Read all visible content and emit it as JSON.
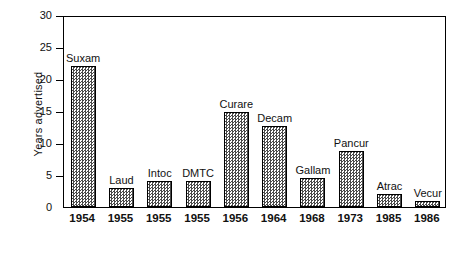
{
  "chart_data": {
    "type": "bar",
    "title": "",
    "xlabel": "",
    "ylabel": "Years advertised",
    "ylim": [
      0,
      30
    ],
    "yticks": [
      0,
      5,
      10,
      15,
      20,
      25,
      30
    ],
    "ytick_labels": [
      "0",
      "5",
      "10",
      "15",
      "20",
      "25",
      "30"
    ],
    "grid": false,
    "legend": "none",
    "categories": [
      "1954",
      "1955",
      "1955",
      "1955",
      "1956",
      "1964",
      "1968",
      "1973",
      "1985",
      "1986"
    ],
    "bar_labels": [
      "Suxam",
      "Laud",
      "Intoc",
      "DMTC",
      "Curare",
      "Decam",
      "Gallam",
      "Pancur",
      "Atrac",
      "Vecur"
    ],
    "values": [
      22,
      3,
      4,
      4,
      14.8,
      12.7,
      4.6,
      8.7,
      2,
      1
    ],
    "series": [
      {
        "name": "Years advertised",
        "values": [
          22,
          3,
          4,
          4,
          14.8,
          12.7,
          4.6,
          8.7,
          2,
          1
        ]
      }
    ],
    "bars": [
      {
        "label": "Suxam",
        "year": "1954",
        "value": 22
      },
      {
        "label": "Laud",
        "year": "1955",
        "value": 3
      },
      {
        "label": "Intoc",
        "year": "1955",
        "value": 4
      },
      {
        "label": "DMTC",
        "year": "1955",
        "value": 4
      },
      {
        "label": "Curare",
        "year": "1956",
        "value": 14.8
      },
      {
        "label": "Decam",
        "year": "1964",
        "value": 12.7
      },
      {
        "label": "Gallam",
        "year": "1968",
        "value": 4.6
      },
      {
        "label": "Pancur",
        "year": "1973",
        "value": 8.7
      },
      {
        "label": "Atrac",
        "year": "1985",
        "value": 2
      },
      {
        "label": "Vecur",
        "year": "1986",
        "value": 1
      }
    ],
    "bar_fill": "#4a4a4a",
    "bar_edge": "#000000",
    "axis_color": "#000000",
    "background": "#ffffff"
  }
}
